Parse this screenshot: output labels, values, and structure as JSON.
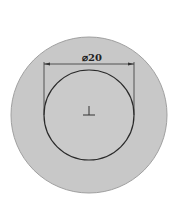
{
  "diagram": {
    "type": "cad-sketch",
    "outer_circle": {
      "cx": 89,
      "cy": 115,
      "r": 78,
      "fill": "#c8c8c8",
      "stroke": "#9a9a9a"
    },
    "inner_circle": {
      "cx": 89,
      "cy": 115,
      "r": 45,
      "fill": "#cbcbcb",
      "stroke": "#2a2a2a"
    },
    "dimension": {
      "label": "⌀20",
      "symbol": "⌀",
      "value": "20",
      "line_y": 64,
      "x1": 44,
      "x2": 134
    },
    "origin_marker": {
      "x": 89,
      "y": 115
    }
  }
}
